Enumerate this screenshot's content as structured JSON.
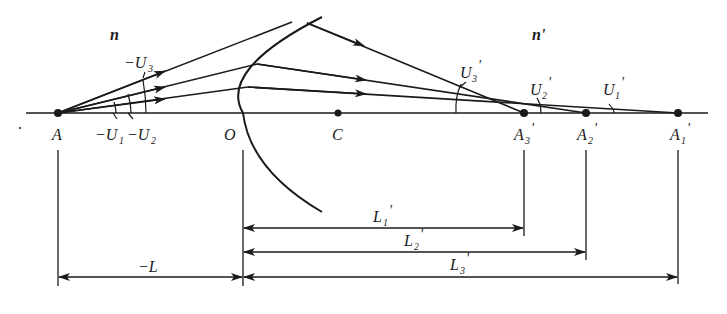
{
  "diagram": {
    "type": "optics-ray-diagram",
    "media": {
      "object_side_index": "n",
      "image_side_index": "n'"
    },
    "points": {
      "object": "A",
      "vertex": "O",
      "center": "C",
      "images": [
        "A3'",
        "A2'",
        "A1'"
      ]
    },
    "labels": {
      "n": "n",
      "n_prime": "n'",
      "A": "A",
      "O": "O",
      "C": "C",
      "A3p": {
        "main": "A",
        "sub": "3",
        "prime": "'"
      },
      "A2p": {
        "main": "A",
        "sub": "2",
        "prime": "'"
      },
      "A1p": {
        "main": "A",
        "sub": "1",
        "prime": "'"
      },
      "neg_U3": {
        "main": "−U",
        "sub": "3"
      },
      "neg_U1": {
        "main": "−U",
        "sub": "1"
      },
      "neg_U2": {
        "main": "−U",
        "sub": "2"
      },
      "U3p": {
        "main": "U",
        "sub": "3",
        "prime": "'"
      },
      "U2p": {
        "main": "U",
        "sub": "2",
        "prime": "'"
      },
      "U1p": {
        "main": "U",
        "sub": "1",
        "prime": "'"
      },
      "neg_L": "−L",
      "L1p": {
        "main": "L",
        "sub": "1",
        "prime": "'"
      },
      "L2p": {
        "main": "L",
        "sub": "2",
        "prime": "'"
      },
      "L3p": {
        "main": "L",
        "sub": "3",
        "prime": "'"
      }
    },
    "dimensions": [
      {
        "label": "−L",
        "from": "A",
        "to": "O"
      },
      {
        "label": "L1'",
        "from": "O",
        "to": "A3'"
      },
      {
        "label": "L2'",
        "from": "O",
        "to": "A2'"
      },
      {
        "label": "L3'",
        "from": "O",
        "to": "A1'"
      }
    ],
    "colors": {
      "ink": "#1a1a1a",
      "background": "#ffffff"
    }
  }
}
